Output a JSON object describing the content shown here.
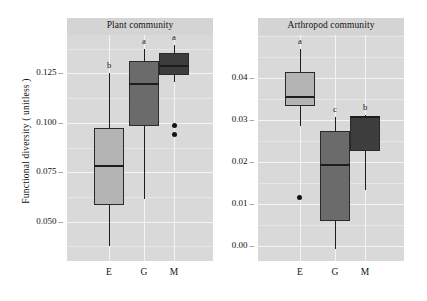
{
  "figure": {
    "ylabel": "Functional diversity ( unitless )"
  },
  "panels": [
    {
      "id": "plant",
      "title": "Plant community",
      "ylim": [
        0.03,
        0.1445
      ],
      "yticks": [
        {
          "value": 0.125,
          "label": "0.125"
        },
        {
          "value": 0.1,
          "label": "0.100"
        },
        {
          "value": 0.075,
          "label": "0.075"
        },
        {
          "value": 0.05,
          "label": "0.050"
        }
      ],
      "xticks": [
        "E",
        "G",
        "M"
      ],
      "boxes": [
        {
          "category": "E",
          "letter": "b",
          "fill": "#b4b4b4",
          "q1": 0.0582,
          "median": 0.0782,
          "q3": 0.0972,
          "whisker_low": 0.0378,
          "whisker_high": 0.1252,
          "outliers": []
        },
        {
          "category": "G",
          "letter": "a",
          "fill": "#6b6b6b",
          "q1": 0.0985,
          "median": 0.1196,
          "q3": 0.1312,
          "whisker_low": 0.0614,
          "whisker_high": 0.1372,
          "outliers": []
        },
        {
          "category": "M",
          "letter": "a",
          "fill": "#3d3d3d",
          "q1": 0.1243,
          "median": 0.1286,
          "q3": 0.1356,
          "whisker_low": 0.1208,
          "whisker_high": 0.1392,
          "outliers": [
            0.0985,
            0.0939
          ]
        }
      ]
    },
    {
      "id": "arthropod",
      "title": "Arthropod community",
      "ylim": [
        -0.0035,
        0.0502
      ],
      "yticks": [
        {
          "value": 0.04,
          "label": "0.04"
        },
        {
          "value": 0.03,
          "label": "0.03"
        },
        {
          "value": 0.02,
          "label": "0.02"
        },
        {
          "value": 0.01,
          "label": "0.01"
        },
        {
          "value": 0.0,
          "label": "0.00"
        }
      ],
      "xticks": [
        "E",
        "G",
        "M"
      ],
      "boxes": [
        {
          "category": "E",
          "letter": "a",
          "fill": "#b4b4b4",
          "q1": 0.0334,
          "median": 0.0354,
          "q3": 0.0415,
          "whisker_low": 0.0285,
          "whisker_high": 0.0468,
          "outliers": [
            0.0116
          ]
        },
        {
          "category": "G",
          "letter": "c",
          "fill": "#6b6b6b",
          "q1": 0.006,
          "median": 0.0193,
          "q3": 0.0275,
          "whisker_low": -0.0006,
          "whisker_high": 0.0306,
          "outliers": []
        },
        {
          "category": "M",
          "letter": "b",
          "fill": "#3d3d3d",
          "q1": 0.0226,
          "median": 0.0306,
          "q3": 0.0306,
          "whisker_low": 0.0134,
          "whisker_high": 0.0312,
          "outliers": []
        }
      ]
    }
  ],
  "chart_data": {
    "type": "box",
    "title": "",
    "xlabel": "",
    "ylabel": "Functional diversity ( unitless )",
    "grid": true,
    "legend": "none",
    "facets": [
      {
        "name": "Plant community",
        "ylim": [
          0.03,
          0.1445
        ],
        "ytick_labels": [
          "0.125",
          "0.100",
          "0.075",
          "0.050"
        ],
        "categories": [
          "E",
          "G",
          "M"
        ],
        "significance_letters": [
          "b",
          "a",
          "a"
        ],
        "boxes": [
          {
            "category": "E",
            "whisker_low": 0.0378,
            "q1": 0.0582,
            "median": 0.0782,
            "q3": 0.0972,
            "whisker_high": 0.1252,
            "outliers": []
          },
          {
            "category": "G",
            "whisker_low": 0.0614,
            "q1": 0.0985,
            "median": 0.1196,
            "q3": 0.1312,
            "whisker_high": 0.1372,
            "outliers": []
          },
          {
            "category": "M",
            "whisker_low": 0.1208,
            "q1": 0.1243,
            "median": 0.1286,
            "q3": 0.1356,
            "whisker_high": 0.1392,
            "outliers": [
              0.0985,
              0.0939
            ]
          }
        ]
      },
      {
        "name": "Arthropod community",
        "ylim": [
          -0.0035,
          0.0502
        ],
        "ytick_labels": [
          "0.04",
          "0.03",
          "0.02",
          "0.01",
          "0.00"
        ],
        "categories": [
          "E",
          "G",
          "M"
        ],
        "significance_letters": [
          "a",
          "c",
          "b"
        ],
        "boxes": [
          {
            "category": "E",
            "whisker_low": 0.0285,
            "q1": 0.0334,
            "median": 0.0354,
            "q3": 0.0415,
            "whisker_high": 0.0468,
            "outliers": [
              0.0116
            ]
          },
          {
            "category": "G",
            "whisker_low": -0.0006,
            "q1": 0.006,
            "median": 0.0193,
            "q3": 0.0275,
            "whisker_high": 0.0306,
            "outliers": []
          },
          {
            "category": "M",
            "whisker_low": 0.0134,
            "q1": 0.0226,
            "median": 0.0306,
            "q3": 0.0306,
            "whisker_high": 0.0312,
            "outliers": []
          }
        ]
      }
    ]
  }
}
